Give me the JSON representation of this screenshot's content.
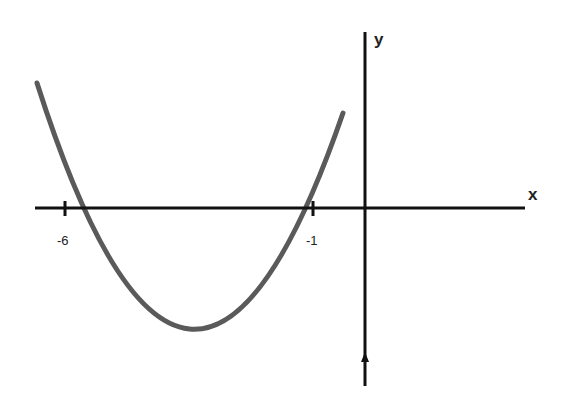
{
  "diagram": {
    "type": "function-graph",
    "axes": {
      "x_label": "x",
      "y_label": "y"
    },
    "ticks": [
      {
        "value": -6,
        "label": "-6"
      },
      {
        "value": -1,
        "label": "-1"
      }
    ],
    "curve": {
      "kind": "parabola",
      "opens": "up",
      "roots": [
        -6,
        -1
      ],
      "vertex_x": -3.5,
      "color": "#555555"
    },
    "colors": {
      "axis": "#111111",
      "curve": "#555555",
      "background": "#ffffff"
    }
  }
}
